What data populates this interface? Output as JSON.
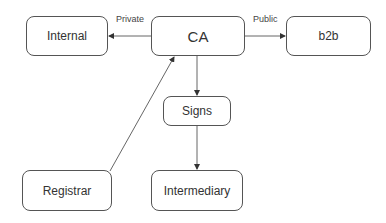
{
  "nodes": {
    "internal": {
      "label": "Internal"
    },
    "ca": {
      "label": "CA"
    },
    "b2b": {
      "label": "b2b"
    },
    "signs": {
      "label": "Signs"
    },
    "registrar": {
      "label": "Registrar"
    },
    "intermediary": {
      "label": "Intermediary"
    }
  },
  "edges": [
    {
      "from": "CA",
      "to": "Internal",
      "label": "Private"
    },
    {
      "from": "CA",
      "to": "b2b",
      "label": "Public"
    },
    {
      "from": "CA",
      "to": "Signs",
      "label": ""
    },
    {
      "from": "Signs",
      "to": "Intermediary",
      "label": ""
    },
    {
      "from": "Registrar",
      "to": "CA",
      "label": ""
    }
  ]
}
